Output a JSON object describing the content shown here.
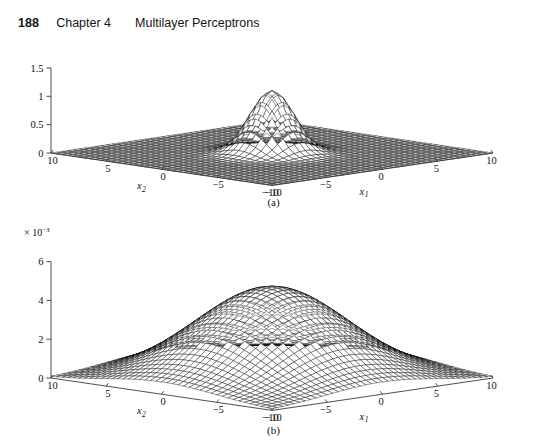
{
  "page": {
    "folio": "188",
    "chapter": "Chapter 4",
    "title": "Multilayer Perceptrons",
    "background": "#ffffff",
    "ink": "#111111"
  },
  "figure": {
    "caption_a": "(a)",
    "caption_b": "(b)"
  },
  "chart_data": [
    {
      "id": "panel-a",
      "type": "surface",
      "title": "",
      "caption": "(a)",
      "xlabel": "x1",
      "ylabel": "x2",
      "zlabel": "",
      "x_ticks": [
        -10,
        -5,
        0,
        5,
        10
      ],
      "x_tick_labels": [
        "-10",
        "-5",
        "0",
        "5",
        "10"
      ],
      "y_ticks": [
        -10,
        -5,
        0,
        5,
        10
      ],
      "y_tick_labels": [
        "-10",
        "-5",
        "0",
        "5",
        "10"
      ],
      "z_ticks": [
        0,
        0.5,
        1,
        1.5
      ],
      "z_tick_labels": [
        "0",
        "0.5",
        "1",
        "1.5"
      ],
      "xlim": [
        -10,
        10
      ],
      "ylim": [
        -10,
        10
      ],
      "zlim": [
        0,
        1.5
      ],
      "z_multiplier": "",
      "grid": false,
      "legend": "none",
      "surface": {
        "function": "gaussian",
        "amplitude": 1.1,
        "sigma": 1.45,
        "x0": 0,
        "y0": 0,
        "peak_value": 1.1,
        "mesh_n": 41,
        "mesh_color": "#000000",
        "face_color": "#ffffff"
      },
      "annotation": "narrow isotropic Gaussian centred at origin, peak ~1.1"
    },
    {
      "id": "panel-b",
      "type": "surface",
      "title": "",
      "caption": "(b)",
      "xlabel": "x1",
      "ylabel": "x2",
      "zlabel": "",
      "x_ticks": [
        -10,
        -5,
        0,
        5,
        10
      ],
      "x_tick_labels": [
        "-10",
        "-5",
        "0",
        "5",
        "10"
      ],
      "y_ticks": [
        -10,
        -5,
        0,
        5,
        10
      ],
      "y_tick_labels": [
        "-10",
        "-5",
        "0",
        "5",
        "10"
      ],
      "z_ticks": [
        0,
        2,
        4,
        6
      ],
      "z_tick_labels": [
        "0",
        "2",
        "4",
        "6"
      ],
      "xlim": [
        -10,
        10
      ],
      "ylim": [
        -10,
        10
      ],
      "zlim": [
        0,
        6
      ],
      "z_multiplier_base": "× 10",
      "z_multiplier_exp": "−3",
      "grid": false,
      "legend": "none",
      "surface": {
        "function": "gaussian",
        "amplitude": 4.7,
        "sigma": 5.0,
        "x0": 0,
        "y0": 0,
        "peak_value": 4.7,
        "mesh_n": 41,
        "mesh_color": "#000000",
        "face_color": "#ffffff"
      },
      "annotation": "broad isotropic Gaussian centred at origin, peak ~4.7e-3"
    }
  ]
}
